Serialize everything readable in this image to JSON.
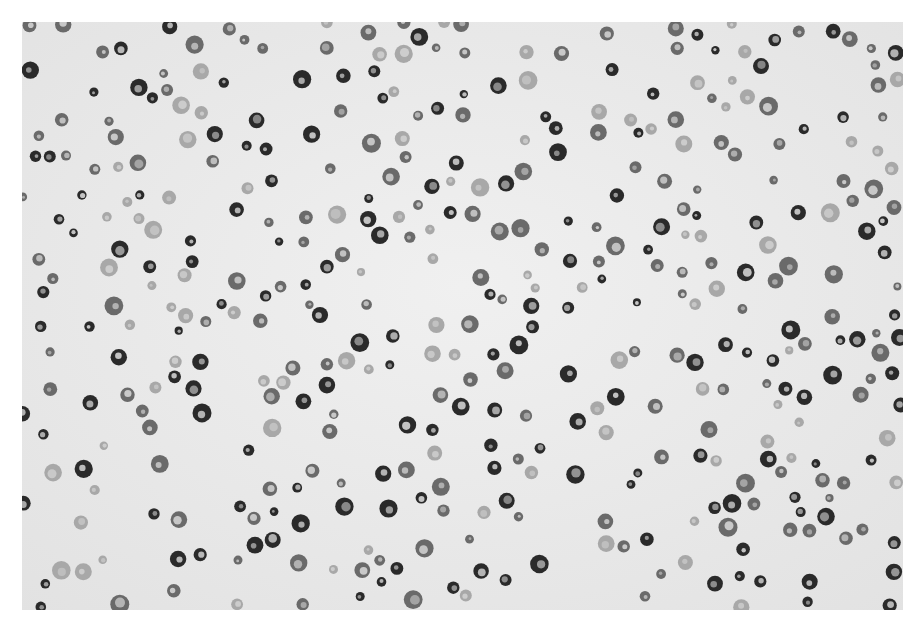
{
  "image": {
    "subject": "micrograph of scattered round cells",
    "palette": {
      "background": "#ebebeb",
      "border": "#ffffff",
      "cell_dark": "#2a2a2a",
      "cell_mid": "#6a6a6a",
      "cell_light": "#a8a8a8",
      "cell_center": "#cfcfcf"
    },
    "cell_count_estimate": 420,
    "seed": 1337
  }
}
